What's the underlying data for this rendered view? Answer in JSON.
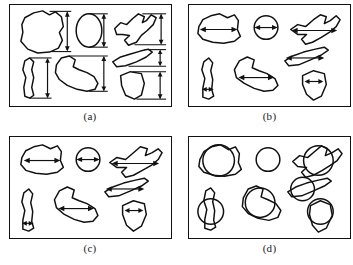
{
  "figure": {
    "columns": 2,
    "rows": 2,
    "background": "#ffffff",
    "ink_color": "#111111"
  },
  "panels": [
    {
      "id": "a",
      "caption": "(a)",
      "measure_name": "vertical-feret-diameter",
      "annotation_type": "vertical-caliper-arrow-outside",
      "shape_count": 6,
      "shapes": [
        {
          "name": "blob-polygon-large",
          "measure_label": "",
          "value": ""
        },
        {
          "name": "ellipse-oval",
          "measure_label": "",
          "value": ""
        },
        {
          "name": "hook-boot-shape",
          "measure_label": "",
          "value": ""
        },
        {
          "name": "narrow-sliver-shape",
          "measure_label": "",
          "value": ""
        },
        {
          "name": "foot-shape",
          "measure_label": "",
          "value": ""
        },
        {
          "name": "wedge-triangle-shape",
          "measure_label": "",
          "value": ""
        }
      ]
    },
    {
      "id": "b",
      "caption": "(b)",
      "measure_name": "horizontal-chord-width",
      "annotation_type": "horizontal-double-arrow-inside",
      "shape_count": 6,
      "shapes": [
        {
          "name": "blob-polygon-large",
          "measure_label": "",
          "value": ""
        },
        {
          "name": "circle-shape",
          "measure_label": "",
          "value": ""
        },
        {
          "name": "hook-boot-shape",
          "measure_label": "",
          "value": ""
        },
        {
          "name": "narrow-sliver-shape",
          "measure_label": "",
          "value": ""
        },
        {
          "name": "foot-shape",
          "measure_label": "",
          "value": ""
        },
        {
          "name": "wedge-triangle-shape",
          "measure_label": "",
          "value": ""
        }
      ]
    },
    {
      "id": "c",
      "caption": "(c)",
      "measure_name": "horizontal-martin-diameter",
      "annotation_type": "horizontal-double-arrow-inside",
      "shape_count": 6,
      "shapes": [
        {
          "name": "blob-polygon-large",
          "measure_label": "",
          "value": ""
        },
        {
          "name": "circle-shape",
          "measure_label": "",
          "value": ""
        },
        {
          "name": "hook-boot-shape",
          "measure_label": "",
          "value": ""
        },
        {
          "name": "narrow-sliver-shape",
          "measure_label": "",
          "value": ""
        },
        {
          "name": "foot-shape",
          "measure_label": "",
          "value": ""
        },
        {
          "name": "wedge-triangle-shape",
          "measure_label": "",
          "value": ""
        }
      ]
    },
    {
      "id": "d",
      "caption": "(d)",
      "measure_name": "equivalent-area-circle-diameter",
      "annotation_type": "overlaid-circle",
      "shape_count": 6,
      "shapes": [
        {
          "name": "blob-polygon-large",
          "measure_label": "",
          "value": ""
        },
        {
          "name": "circle-shape",
          "measure_label": "",
          "value": ""
        },
        {
          "name": "hook-boot-shape",
          "measure_label": "",
          "value": ""
        },
        {
          "name": "narrow-sliver-shape",
          "measure_label": "",
          "value": ""
        },
        {
          "name": "foot-shape",
          "measure_label": "",
          "value": ""
        },
        {
          "name": "wedge-triangle-shape",
          "measure_label": "",
          "value": ""
        }
      ]
    }
  ]
}
